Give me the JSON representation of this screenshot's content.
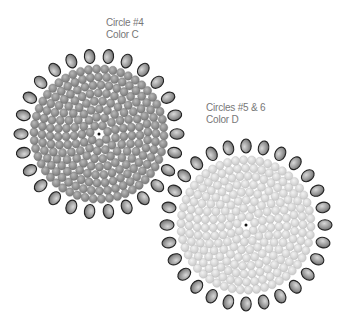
{
  "labels": {
    "circle4": {
      "line1": "Circle #4",
      "line2": "Color C",
      "x": 106,
      "y": 17
    },
    "circle56": {
      "line1": "Circles #5 & 6",
      "line2": "Color D",
      "x": 206,
      "y": 102
    }
  },
  "circles": [
    {
      "name": "circle-4",
      "cx": 99,
      "cy": 134,
      "bead_fill": "#8e8e8e",
      "bead_stroke": "#6e6e6e",
      "inner_rings": [
        0,
        9,
        17,
        25,
        33,
        41,
        49,
        57,
        65
      ],
      "outer_radius": 78,
      "outer_count": 26,
      "outer_fill": "#9a9a9a",
      "outer_stroke": "#222222"
    },
    {
      "name": "circle-5-6",
      "cx": 246,
      "cy": 225,
      "bead_fill": "#dcdcdc",
      "bead_stroke": "#b8b8b8",
      "inner_rings": [
        0,
        9,
        17,
        25,
        33,
        41,
        49,
        57,
        65
      ],
      "outer_radius": 79,
      "outer_count": 28,
      "outer_fill": "#a0a0a0",
      "outer_stroke": "#222222"
    }
  ]
}
